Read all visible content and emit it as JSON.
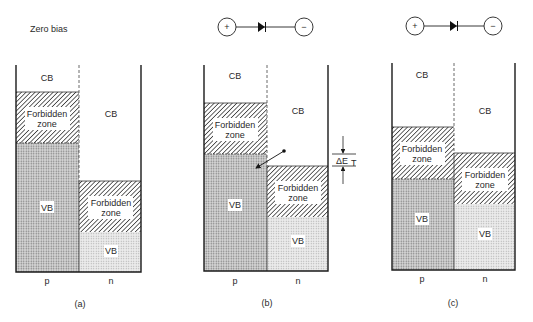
{
  "title": "Zero bias",
  "labels": {
    "cb": "CB",
    "vb": "VB",
    "forbidden_line1": "Forbidden",
    "forbidden_line2": "zone",
    "p": "p",
    "n": "n",
    "delta_et": "ΔE",
    "delta_et_sub": "T",
    "plus": "+",
    "minus": "−"
  },
  "panels": [
    {
      "id": "a",
      "caption": "(a)",
      "bias": "zero bias",
      "p_forbidden_top": 92,
      "p_forbidden_bottom": 143,
      "n_forbidden_top": 181,
      "n_forbidden_bottom": 232
    },
    {
      "id": "b",
      "caption": "(b)",
      "bias": "forward bias",
      "p_forbidden_top": 103,
      "p_forbidden_bottom": 154,
      "n_forbidden_top": 166,
      "n_forbidden_bottom": 217
    },
    {
      "id": "c",
      "caption": "(c)",
      "bias": "forward bias (larger)",
      "p_forbidden_top": 127,
      "p_forbidden_bottom": 179,
      "n_forbidden_top": 153,
      "n_forbidden_bottom": 204
    }
  ]
}
